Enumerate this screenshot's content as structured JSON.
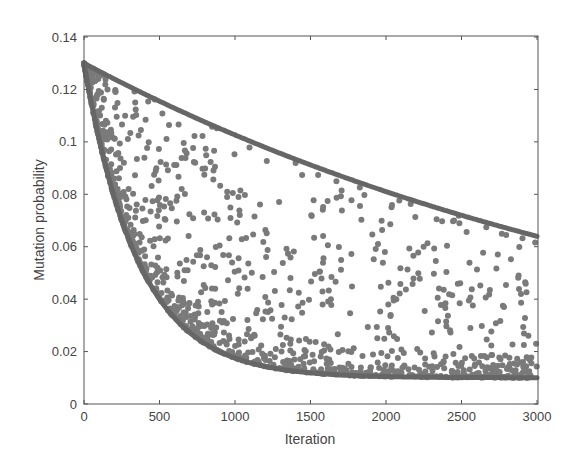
{
  "chart_data": {
    "type": "scatter",
    "title": "",
    "xlabel": "Iteration",
    "ylabel": "Mutation probability",
    "xlim": [
      0,
      3000
    ],
    "ylim": [
      0,
      0.14
    ],
    "xticks": [
      "0",
      "500",
      "1000",
      "1500",
      "2000",
      "2500",
      "3000"
    ],
    "yticks": [
      "0",
      "0.02",
      "0.04",
      "0.06",
      "0.08",
      "0.1",
      "0.12",
      "0.14"
    ],
    "grid": false,
    "legend": null,
    "series": [
      {
        "name": "upper bound",
        "kind": "line",
        "x": [
          0,
          250,
          500,
          750,
          1000,
          1250,
          1500,
          1750,
          2000,
          2250,
          2500,
          2750,
          3000
        ],
        "values": [
          0.13,
          0.123,
          0.115,
          0.109,
          0.103,
          0.097,
          0.091,
          0.086,
          0.081,
          0.076,
          0.072,
          0.068,
          0.064
        ]
      },
      {
        "name": "lower bound",
        "kind": "line",
        "x": [
          0,
          100,
          200,
          300,
          400,
          500,
          750,
          1000,
          1250,
          1500,
          2000,
          2500,
          3000
        ],
        "values": [
          0.13,
          0.101,
          0.079,
          0.062,
          0.049,
          0.04,
          0.024,
          0.017,
          0.013,
          0.011,
          0.01,
          0.01,
          0.01
        ]
      },
      {
        "name": "samples",
        "kind": "scatter",
        "count": 1200,
        "description": "random mutation probabilities between lower and upper bound, concentrated near the lower bound",
        "seed": 12345
      }
    ]
  },
  "colors": {
    "curve": "#666666",
    "dots": "#7a7a7a",
    "axis": "#555555"
  }
}
